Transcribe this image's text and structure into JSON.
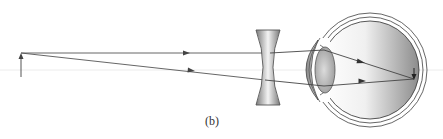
{
  "figure": {
    "caption": "(b)",
    "colors": {
      "background": "#ffffff",
      "ray": "#555555",
      "axis": "#e6e6e6",
      "lens_dark": "#707070",
      "lens_light": "#f2f2f2",
      "eye_outline": "#444444"
    }
  },
  "elements": {
    "object_arrow": {
      "x": 21,
      "y_base": 77,
      "y_tip": 53
    },
    "optical_axis": {
      "y": 70
    },
    "corrective_lens": {
      "type": "concave",
      "x_left": 256,
      "x_right": 280,
      "y_top": 30,
      "y_bottom": 105
    },
    "eye": {
      "center_x": 370,
      "center_y": 70,
      "radius": 52
    },
    "crystalline_lens": {
      "cx": 325,
      "cy": 70,
      "rx": 10,
      "ry": 23
    },
    "focus_point": {
      "x": 414,
      "y": 79
    }
  },
  "rays": [
    {
      "name": "upper-ray",
      "points": [
        [
          21,
          53
        ],
        [
          270,
          53
        ],
        [
          324,
          50
        ],
        [
          414,
          79
        ]
      ],
      "arrows": [
        [
          187,
          53
        ],
        [
          362,
          62
        ]
      ]
    },
    {
      "name": "lower-ray",
      "points": [
        [
          21,
          53
        ],
        [
          265,
          80
        ],
        [
          324,
          86
        ],
        [
          414,
          79
        ]
      ],
      "arrows": [
        [
          192,
          70
        ],
        [
          362,
          81
        ]
      ]
    }
  ]
}
